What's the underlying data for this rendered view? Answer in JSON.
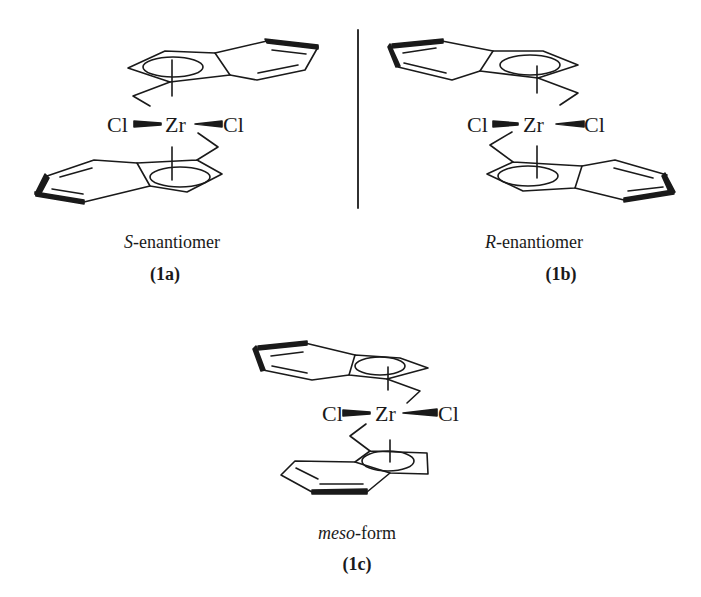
{
  "figure": {
    "structures": [
      {
        "id": "1a",
        "caption_prefix": "S",
        "caption_suffix": "-enantiomer",
        "label_open": "(",
        "label_text": "1a",
        "label_close": ")",
        "metal": "Zr",
        "ligand_left": "Cl",
        "ligand_right": "Cl"
      },
      {
        "id": "1b",
        "caption_prefix": "R",
        "caption_suffix": "-enantiomer",
        "label_open": "(",
        "label_text": "1b",
        "label_close": ")",
        "metal": "Zr",
        "ligand_left": "Cl",
        "ligand_right": "Cl"
      },
      {
        "id": "1c",
        "caption_prefix": "meso",
        "caption_suffix": "-form",
        "label_open": "(",
        "label_text": "1c",
        "label_close": ")",
        "metal": "Zr",
        "ligand_left": "Cl",
        "ligand_right": "Cl"
      }
    ],
    "mirror_line": "mirror-plane-divider",
    "colors": {
      "ink": "#1a1a1a",
      "background": "#ffffff"
    }
  }
}
